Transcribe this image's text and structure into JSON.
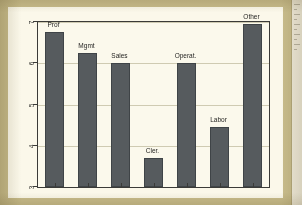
{
  "figure": {
    "y_axis_label": "mean of tenure",
    "y_ticks": [
      "3",
      "4",
      "5",
      "6",
      "7"
    ],
    "edge_note": ""
  },
  "chart_data": {
    "type": "bar",
    "title": "",
    "xlabel": "",
    "ylabel": "mean of tenure",
    "categories": [
      "Prof",
      "Mgmt",
      "Sales",
      "Cler.",
      "Operat.",
      "Labor",
      "Other"
    ],
    "values": [
      6.75,
      6.25,
      6.0,
      3.7,
      6.0,
      4.45,
      6.95
    ],
    "ylim": [
      3,
      7
    ],
    "yticks": [
      3,
      4,
      5,
      6,
      7
    ],
    "grid": true,
    "legend": "none",
    "bar_color": "#565b5e",
    "plot_background": "#fbf9ec",
    "page_background": "#c8bc8b",
    "labels_position": "above-bar"
  }
}
